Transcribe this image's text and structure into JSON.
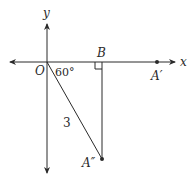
{
  "diagram": {
    "axes": {
      "x_label": "x",
      "y_label": "y"
    },
    "points": {
      "origin": "O",
      "b": "B",
      "a_prime": "A′",
      "a_double_prime": "A″"
    },
    "angle_label": "60°",
    "length_label": "3",
    "colors": {
      "stroke": "#2a2a2a",
      "background": "#ffffff"
    }
  }
}
